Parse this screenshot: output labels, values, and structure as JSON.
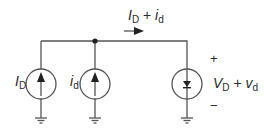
{
  "diagram": {
    "type": "small-signal circuit",
    "top_current_label": {
      "main": "I",
      "main_sub": "D",
      "plus": "+",
      "small": "i",
      "small_sub": "d"
    },
    "source_dc": {
      "symbol": "I",
      "sub": "D",
      "kind": "current-source",
      "direction": "up"
    },
    "source_ac": {
      "symbol": "i",
      "sub": "d",
      "kind": "current-source",
      "direction": "up"
    },
    "diode_element": {
      "kind": "diode-in-circle",
      "voltage": {
        "main": "V",
        "main_sub": "D",
        "plus": "+",
        "small": "v",
        "small_sub": "d"
      },
      "polarity_plus": "+",
      "polarity_minus": "−"
    },
    "grounds": 3,
    "junction_dot": true,
    "colors": {
      "wire": "#555555",
      "text": "#2a2a2a",
      "background": "#ffffff"
    }
  }
}
